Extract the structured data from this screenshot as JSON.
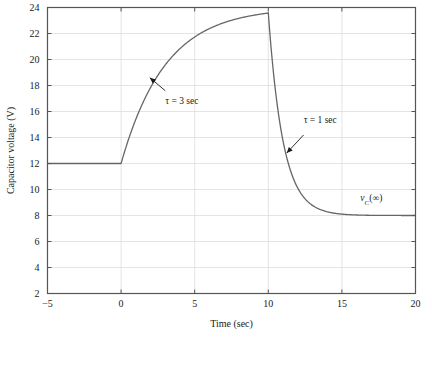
{
  "chart_data": {
    "type": "line",
    "title": "",
    "xlabel": "Time (sec)",
    "ylabel": "Capacitor voltage (V)",
    "xlim": [
      -5,
      20
    ],
    "ylim": [
      2,
      24
    ],
    "xticks": [
      -5,
      0,
      5,
      10,
      15,
      20
    ],
    "xtick_labels": [
      "−5",
      "0",
      "5",
      "10",
      "15",
      "20"
    ],
    "yticks": [
      2,
      4,
      6,
      8,
      10,
      12,
      14,
      16,
      18,
      20,
      22,
      24
    ],
    "ytick_labels": [
      "2",
      "4",
      "6",
      "8",
      "10",
      "12",
      "14",
      "16",
      "18",
      "20",
      "22",
      "24"
    ],
    "grid": true,
    "grid_axis": "y",
    "legend": "none",
    "series": [
      {
        "name": "capacitor voltage",
        "color": "#666666",
        "description": "Initial steady value 12 V for t<0; exponential charge with tau=3 s toward 24 V during 0<=t<=10 reaching 23.6 V; exponential discharge with tau=1 s toward 8 V for t>10.",
        "segments": [
          {
            "kind": "constant",
            "x_start": -5,
            "x_end": 0,
            "value": 12
          },
          {
            "kind": "exponential",
            "x_start": 0,
            "x_end": 10,
            "v_initial": 12,
            "v_final": 24,
            "tau": 3,
            "v_at_end": 23.6
          },
          {
            "kind": "exponential",
            "x_start": 10,
            "x_end": 20,
            "v_initial": 23.6,
            "v_final": 8,
            "tau": 1,
            "v_at_end": 8.0
          }
        ],
        "points": [
          {
            "x": -5,
            "y": 12.0
          },
          {
            "x": -2.5,
            "y": 12.0
          },
          {
            "x": 0,
            "y": 12.0
          },
          {
            "x": 1,
            "y": 15.4
          },
          {
            "x": 2,
            "y": 17.8
          },
          {
            "x": 3,
            "y": 19.6
          },
          {
            "x": 4,
            "y": 20.8
          },
          {
            "x": 5,
            "y": 21.7
          },
          {
            "x": 6,
            "y": 22.4
          },
          {
            "x": 7,
            "y": 22.8
          },
          {
            "x": 8,
            "y": 23.1
          },
          {
            "x": 9,
            "y": 23.4
          },
          {
            "x": 10,
            "y": 23.6
          },
          {
            "x": 10.5,
            "y": 17.5
          },
          {
            "x": 11,
            "y": 13.7
          },
          {
            "x": 12,
            "y": 10.1
          },
          {
            "x": 13,
            "y": 8.8
          },
          {
            "x": 14,
            "y": 8.3
          },
          {
            "x": 15,
            "y": 8.1
          },
          {
            "x": 17,
            "y": 8.0
          },
          {
            "x": 20,
            "y": 8.0
          }
        ]
      }
    ],
    "annotations": [
      {
        "name": "tau-charge",
        "text": "τ = 3 sec",
        "text_x": 3.0,
        "text_y": 16.6,
        "arrow_from_x": 3.0,
        "arrow_from_y": 17.6,
        "arrow_to_x": 1.95,
        "arrow_to_y": 18.6
      },
      {
        "name": "tau-discharge",
        "text": "τ = 1 sec",
        "text_x": 12.4,
        "text_y": 15.1,
        "arrow_from_x": 12.4,
        "arrow_from_y": 14.2,
        "arrow_to_x": 11.25,
        "arrow_to_y": 12.8
      },
      {
        "name": "final-value",
        "text_plain": "vC(∞)",
        "text_parts": {
          "v": "v",
          "sub": "C",
          "rest": "(∞)"
        },
        "text_x": 17.0,
        "text_y": 9.1
      }
    ]
  },
  "colors": {
    "curve": "#666666",
    "grid": "#dddddd",
    "frame": "#555555",
    "text": "#1a1a1a",
    "background": "#ffffff"
  }
}
